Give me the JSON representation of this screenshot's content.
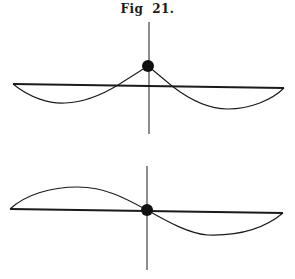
{
  "figure": {
    "caption": "Fig  21.",
    "ink_color": "#1a1a1a",
    "background": "#ffffff"
  },
  "panels": [
    {
      "name": "top",
      "description": "String with central mass displaced upward; two symmetric sag curves below the baseline",
      "baseline": {
        "x1": 13,
        "y1": 84,
        "x2": 284,
        "y2": 88
      },
      "vertical_axis": {
        "x": 149,
        "y1": 22,
        "y2": 134
      },
      "mass": {
        "cx": 148,
        "cy": 66,
        "r": 6
      }
    },
    {
      "name": "bottom",
      "description": "String with mass at center on baseline; antisymmetric S-shaped mode",
      "baseline": {
        "x1": 10,
        "y1": 209,
        "x2": 283,
        "y2": 213
      },
      "vertical_axis": {
        "x": 147,
        "y1": 166,
        "y2": 270
      },
      "mass": {
        "cx": 147,
        "cy": 210,
        "r": 6
      }
    }
  ]
}
